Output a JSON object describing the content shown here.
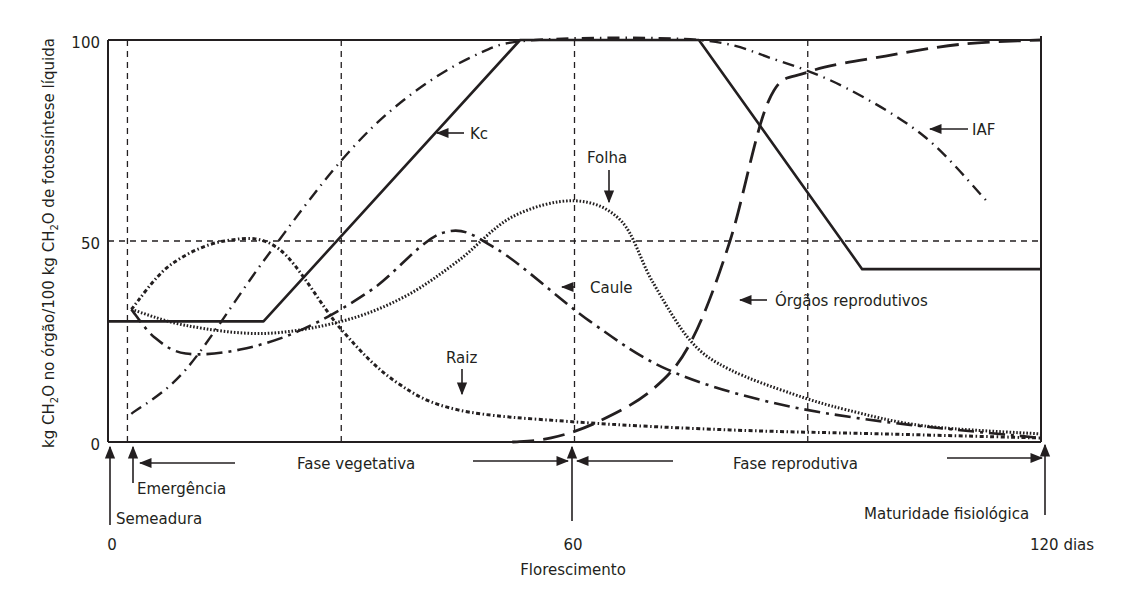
{
  "chart_data": {
    "type": "line",
    "title": "",
    "xlabel": "",
    "ylabel": "kg CH2O no órgão/100 kg CH2O de fotossíntese líquida",
    "ylabel_parts": {
      "pre": "kg CH",
      "sub": "2",
      "mid": "O no órgão/100 kg CH",
      "sub2": "2",
      "post": "O de fotossíntese líquida"
    },
    "xlim": [
      0,
      120
    ],
    "ylim": [
      0,
      100
    ],
    "y_ticks": [
      "0",
      "50",
      "100"
    ],
    "x_ticks": [
      {
        "value": 0,
        "label": "0"
      },
      {
        "value": 60,
        "label": "60"
      },
      {
        "value": 120,
        "label": "120 dias"
      }
    ],
    "reference_lines": {
      "vertical_days": [
        2.5,
        30,
        60,
        90
      ],
      "horizontal_values": [
        50
      ]
    },
    "series": [
      {
        "name": "Kc",
        "style": "solid",
        "points": [
          [
            0,
            30
          ],
          [
            20,
            30
          ],
          [
            53,
            100
          ],
          [
            76,
            100
          ],
          [
            97,
            43
          ],
          [
            120,
            43
          ]
        ]
      },
      {
        "name": "IAF",
        "style": "dash-dot-dot",
        "points": [
          [
            3,
            7
          ],
          [
            10,
            18
          ],
          [
            20,
            45
          ],
          [
            30,
            70
          ],
          [
            38,
            85
          ],
          [
            47,
            96
          ],
          [
            55,
            100
          ],
          [
            76,
            100
          ],
          [
            86,
            95
          ],
          [
            95,
            88
          ],
          [
            105,
            76
          ],
          [
            113,
            60
          ]
        ]
      },
      {
        "name": "Raiz",
        "style": "dotted-dash",
        "points": [
          [
            3,
            33
          ],
          [
            8,
            44
          ],
          [
            15,
            50
          ],
          [
            22,
            48
          ],
          [
            30,
            28
          ],
          [
            37,
            15
          ],
          [
            45,
            8
          ],
          [
            60,
            5
          ],
          [
            80,
            3
          ],
          [
            100,
            2
          ],
          [
            120,
            1
          ]
        ]
      },
      {
        "name": "Caule",
        "style": "dash-dot",
        "points": [
          [
            3,
            33
          ],
          [
            6,
            26
          ],
          [
            10,
            22
          ],
          [
            17,
            23
          ],
          [
            25,
            28
          ],
          [
            34,
            38
          ],
          [
            43,
            52
          ],
          [
            50,
            48
          ],
          [
            62,
            30
          ],
          [
            72,
            18
          ],
          [
            85,
            10
          ],
          [
            100,
            5
          ],
          [
            120,
            1
          ]
        ]
      },
      {
        "name": "Folha",
        "style": "dotted",
        "points": [
          [
            3,
            33
          ],
          [
            10,
            29
          ],
          [
            20,
            27
          ],
          [
            30,
            30
          ],
          [
            38,
            36
          ],
          [
            45,
            45
          ],
          [
            52,
            56
          ],
          [
            60,
            60
          ],
          [
            66,
            55
          ],
          [
            70,
            40
          ],
          [
            75,
            25
          ],
          [
            80,
            18
          ],
          [
            88,
            12
          ],
          [
            95,
            8
          ],
          [
            105,
            4
          ],
          [
            120,
            2
          ]
        ]
      },
      {
        "name": "Órgãos reprodutivos",
        "style": "long-dash",
        "points": [
          [
            52,
            0
          ],
          [
            57,
            1
          ],
          [
            63,
            5
          ],
          [
            70,
            13
          ],
          [
            75,
            25
          ],
          [
            80,
            50
          ],
          [
            85,
            85
          ],
          [
            90,
            92
          ],
          [
            100,
            96
          ],
          [
            110,
            99
          ],
          [
            120,
            100
          ]
        ]
      }
    ],
    "annotations": [
      {
        "text": "Kc",
        "arrow_to": [
          47,
          80
        ]
      },
      {
        "text": "IAF",
        "arrow_to": [
          110,
          72
        ]
      },
      {
        "text": "Folha",
        "arrow_to": [
          65,
          58
        ]
      },
      {
        "text": "Caule",
        "arrow_to": [
          62,
          38
        ]
      },
      {
        "text": "Raiz",
        "arrow_to": [
          46,
          11
        ]
      },
      {
        "text": "Órgãos reprodutivos",
        "arrow_to": [
          81,
          36
        ]
      }
    ],
    "phases": [
      {
        "label": "Fase vegetativa",
        "from_day": 2.5,
        "to_day": 60
      },
      {
        "label": "Fase reprodutiva",
        "from_day": 60,
        "to_day": 120
      }
    ],
    "events": [
      {
        "label": "Semeadura",
        "day": 0
      },
      {
        "label": "Emergência",
        "day": 2.5
      },
      {
        "label": "Florescimento",
        "day": 60
      },
      {
        "label": "Maturidade fisiológica",
        "day": 120
      }
    ],
    "grid": false,
    "legend": "inline labels with arrows"
  },
  "labels": {
    "kc": "Kc",
    "iaf": "IAF",
    "folha": "Folha",
    "caule": "Caule",
    "raiz": "Raiz",
    "orgaos": "Órgãos reprodutivos",
    "fase_vegetativa": "Fase vegetativa",
    "fase_reprodutiva": "Fase reprodutiva",
    "semeadura": "Semeadura",
    "emergencia": "Emergência",
    "florescimento": "Florescimento",
    "maturidade": "Maturidade fisiológica",
    "y0": "0",
    "y50": "50",
    "y100": "100",
    "x0": "0",
    "x60": "60",
    "x120": "120 dias"
  }
}
